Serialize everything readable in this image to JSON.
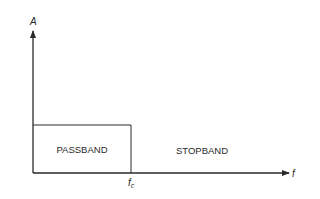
{
  "diagram": {
    "y_axis_label": "A",
    "x_axis_label": "f",
    "cutoff_label_main": "f",
    "cutoff_label_sub": "c",
    "passband_label": "PASSBAND",
    "stopband_label": "STOPBAND",
    "line_color": "#2a2a2a"
  }
}
